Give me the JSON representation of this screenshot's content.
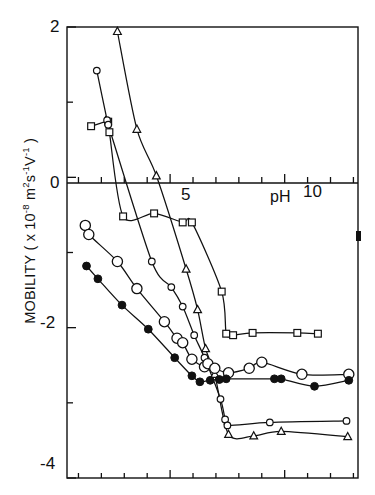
{
  "figure": {
    "title": "",
    "y_axis_label": "MOBILITY ( x 10⁻⁸ m² s⁻¹ V⁻¹ )",
    "y_axis_label_parts": {
      "prefix": "MOBILITY ( x 10",
      "exp1": "-8",
      "mid": " m",
      "exp2": "2",
      "mid2": "s",
      "exp3": "-1",
      "mid3": "V",
      "exp4": "-1",
      "suffix": " )"
    },
    "x_axis_label": "pH",
    "y_ticks_labeled": [
      "2",
      "0",
      "-2",
      "-4"
    ],
    "x_ticks_labeled": [
      "5",
      "10"
    ]
  },
  "chart_data": {
    "type": "scatter",
    "title": "",
    "xlabel": "pH",
    "ylabel": "MOBILITY ( x 10⁻⁸ m² s⁻¹ V⁻¹ )",
    "xlim": [
      0.5,
      13.2
    ],
    "ylim": [
      -4,
      2
    ],
    "xticks_major": [
      5,
      10
    ],
    "xticks_minor": [
      1,
      2,
      3,
      4,
      6,
      7,
      8,
      9,
      11,
      12,
      13
    ],
    "yticks_major": [
      2,
      0,
      -2,
      -4
    ],
    "yticks_minor": [
      1,
      -1,
      -3
    ],
    "grid": false,
    "legend": "none",
    "series": [
      {
        "name": "squares",
        "marker": "open-square",
        "points": [
          [
            1.55,
            0.68
          ],
          [
            2.3,
            0.74
          ],
          [
            2.35,
            0.6
          ],
          [
            2.95,
            -0.52
          ],
          [
            4.3,
            -0.48
          ],
          [
            5.55,
            -0.6
          ],
          [
            5.95,
            -0.6
          ],
          [
            7.25,
            -1.52
          ],
          [
            7.45,
            -2.08
          ],
          [
            7.75,
            -2.1
          ],
          [
            8.6,
            -2.07
          ],
          [
            10.55,
            -2.07
          ],
          [
            11.45,
            -2.08
          ]
        ]
      },
      {
        "name": "triangles",
        "marker": "open-triangle",
        "points": [
          [
            2.7,
            1.94
          ],
          [
            3.55,
            0.64
          ],
          [
            4.4,
            0.02
          ],
          [
            5.7,
            -1.22
          ],
          [
            6.2,
            -1.76
          ],
          [
            6.55,
            -2.28
          ],
          [
            6.95,
            -2.62
          ],
          [
            7.55,
            -3.42
          ],
          [
            8.65,
            -3.44
          ],
          [
            9.85,
            -3.38
          ],
          [
            12.75,
            -3.45
          ]
        ]
      },
      {
        "name": "small-open-circles",
        "marker": "small-open-circle",
        "points": [
          [
            1.8,
            1.42
          ],
          [
            2.25,
            0.76
          ],
          [
            2.3,
            0.7
          ],
          [
            4.2,
            -1.12
          ],
          [
            5.05,
            -1.46
          ],
          [
            5.55,
            -1.72
          ],
          [
            6.05,
            -2.1
          ],
          [
            6.5,
            -2.4
          ],
          [
            7.2,
            -2.95
          ],
          [
            7.4,
            -3.22
          ],
          [
            7.5,
            -3.3
          ],
          [
            9.35,
            -3.26
          ],
          [
            12.7,
            -3.24
          ]
        ]
      },
      {
        "name": "large-open-circles",
        "marker": "large-open-circle",
        "points": [
          [
            1.3,
            -0.64
          ],
          [
            1.45,
            -0.76
          ],
          [
            2.7,
            -1.12
          ],
          [
            3.55,
            -1.48
          ],
          [
            4.75,
            -1.92
          ],
          [
            5.3,
            -2.14
          ],
          [
            5.55,
            -2.2
          ],
          [
            5.95,
            -2.42
          ],
          [
            6.5,
            -2.52
          ],
          [
            6.65,
            -2.48
          ],
          [
            6.95,
            -2.54
          ],
          [
            7.55,
            -2.6
          ],
          [
            8.45,
            -2.54
          ],
          [
            9.0,
            -2.46
          ],
          [
            10.75,
            -2.62
          ],
          [
            12.8,
            -2.62
          ]
        ]
      },
      {
        "name": "filled-circles",
        "marker": "filled-circle",
        "points": [
          [
            1.35,
            -1.18
          ],
          [
            1.85,
            -1.35
          ],
          [
            2.9,
            -1.7
          ],
          [
            4.05,
            -2.02
          ],
          [
            5.2,
            -2.4
          ],
          [
            5.95,
            -2.64
          ],
          [
            6.3,
            -2.72
          ],
          [
            6.75,
            -2.7
          ],
          [
            7.15,
            -2.69
          ],
          [
            7.45,
            -2.68
          ],
          [
            9.55,
            -2.68
          ],
          [
            9.85,
            -2.68
          ],
          [
            11.3,
            -2.78
          ],
          [
            12.8,
            -2.7
          ]
        ]
      }
    ]
  }
}
